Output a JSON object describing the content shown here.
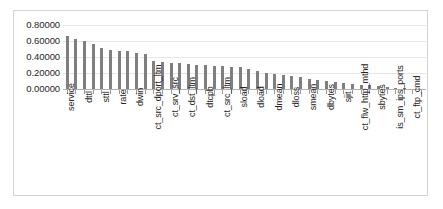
{
  "chart_data": {
    "type": "bar",
    "title": "",
    "xlabel": "",
    "ylabel": "",
    "ylim": [
      0.0,
      0.8
    ],
    "ytick_labels": [
      "0.80000",
      "0.60000",
      "0.40000",
      "0.20000",
      "0.00000"
    ],
    "ytick_values": [
      0.8,
      0.6,
      0.4,
      0.2,
      0.0
    ],
    "grid": true,
    "legend": "none",
    "label_interval": 2,
    "bar_color": "#7f7f7f",
    "categories": [
      "service",
      "",
      "dttl",
      "",
      "sttl",
      "",
      "rate",
      "",
      "dwin",
      "",
      "ct_src_dport_ltm",
      "",
      "ct_srv_src",
      "",
      "ct_dst_ltm",
      "",
      "dtcpb",
      "",
      "ct_src_ltm",
      "",
      "sload",
      "",
      "dload",
      "",
      "dmean",
      "",
      "dloss",
      "",
      "smean",
      "",
      "dbytes",
      "",
      "sjit",
      "",
      "ct_flw_http_mthd",
      "",
      "sbytes",
      "",
      "is_sm_ips_ports",
      "",
      "ct_ftp_cmd",
      ""
    ],
    "labeled_categories": [
      "service",
      "dttl",
      "sttl",
      "rate",
      "dwin",
      "ct_src_dport_ltm",
      "ct_srv_src",
      "ct_dst_ltm",
      "dtcpb",
      "ct_src_ltm",
      "sload",
      "dload",
      "dmean",
      "dloss",
      "smean",
      "dbytes",
      "sjit",
      "ct_flw_http_mthd",
      "sbytes",
      "is_sm_ips_ports",
      "ct_ftp_cmd"
    ],
    "values": [
      0.665,
      0.625,
      0.6,
      0.56,
      0.51,
      0.49,
      0.48,
      0.47,
      0.455,
      0.44,
      0.35,
      0.34,
      0.33,
      0.32,
      0.31,
      0.3,
      0.295,
      0.29,
      0.285,
      0.278,
      0.27,
      0.255,
      0.23,
      0.205,
      0.19,
      0.175,
      0.16,
      0.145,
      0.13,
      0.118,
      0.105,
      0.092,
      0.08,
      0.068,
      0.055,
      0.045,
      0.035,
      0.026,
      0.018,
      0.011,
      0.006,
      0.002
    ]
  }
}
